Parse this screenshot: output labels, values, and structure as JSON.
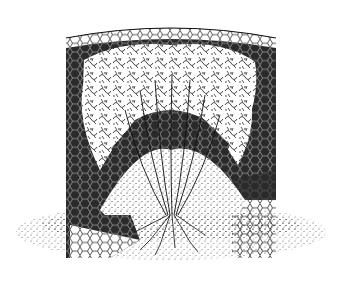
{
  "illustration": {
    "subject": "Plant inside a cylindrical wire-mesh cage set into the ground",
    "style": "black ink stipple drawing",
    "colors": {
      "ink": "#111111",
      "paper": "#ffffff"
    },
    "elements": [
      "wire-mesh-cylinder",
      "leafy-foliage",
      "plant-stems",
      "soil-mound",
      "roots",
      "ground-stipple"
    ]
  }
}
